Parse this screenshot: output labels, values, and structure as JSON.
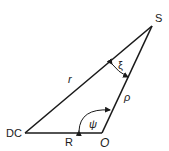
{
  "diagram": {
    "vertices": {
      "DC": {
        "label": "DC",
        "x": 25,
        "y": 133
      },
      "O": {
        "label": "O",
        "x": 102,
        "y": 133
      },
      "S": {
        "label": "S",
        "x": 152,
        "y": 26
      }
    },
    "sides": {
      "r": {
        "label": "r",
        "from": "DC",
        "to": "S"
      },
      "R": {
        "label": "R",
        "from": "DC",
        "to": "O"
      },
      "rho": {
        "label": "ρ",
        "from": "O",
        "to": "S"
      }
    },
    "angles": {
      "xi": {
        "label": "ξ",
        "at": "S"
      },
      "psi": {
        "label": "ψ",
        "at": "O"
      }
    },
    "colors": {
      "line": "#1a1a1a",
      "background": "#ffffff"
    }
  }
}
